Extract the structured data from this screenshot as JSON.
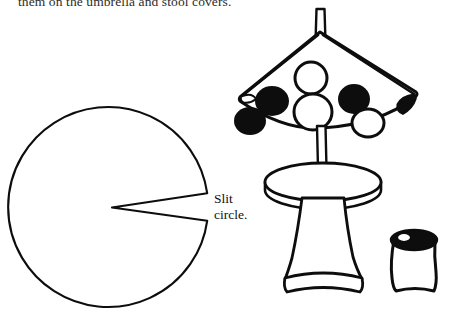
{
  "page": {
    "width": 457,
    "height": 310,
    "background_color": "#ffffff",
    "ink_color": "#0d0d0d",
    "caption_top": "them on the umbrella and stool covers.",
    "figure_description": "Line drawing craft diagram: a slit circle pattern, a polka-dot umbrella over a pedestal stool, and a small thread spool / can"
  },
  "labels": {
    "slit_circle": "Slit\ncircle.",
    "slit_circle_line1": "Slit",
    "slit_circle_line2": "circle."
  },
  "parts": {
    "slit_circle": {
      "name": "Slit circle",
      "center_x": 108,
      "center_y": 207,
      "radius": 100,
      "slit_opening_angle_deg": 8,
      "slit_side": "right",
      "fill": "#ffffff",
      "stroke": "#0d0d0d"
    },
    "umbrella": {
      "name": "Umbrella",
      "canopy_left_tip_x": 238,
      "canopy_right_tip_x": 418,
      "canopy_apex_x": 320,
      "canopy_apex_y": 36,
      "canopy_bottom_y": 124,
      "pole_top_y": 8,
      "pole_bottom_y": 190,
      "dots_filled": 5,
      "dots_outlined": 3,
      "dot_fill_color": "#0d0d0d",
      "dot_outline_color": "#0d0d0d"
    },
    "stool": {
      "name": "Stool",
      "top_center_x": 323,
      "top_center_y": 182,
      "top_radius_x": 58,
      "top_radius_y": 19,
      "top_thickness": 9,
      "base_top_y": 200,
      "base_bottom_y": 292,
      "base_narrow_width": 44,
      "base_flare_width": 78
    },
    "spool": {
      "name": "Spool",
      "left_x": 389,
      "right_x": 440,
      "top_y": 231,
      "bottom_y": 292,
      "lid_fill": "#0d0d0d",
      "body_fill": "#ffffff"
    }
  },
  "icons": {
    "slit_circle_icon": "slit-circle-icon",
    "umbrella_icon": "umbrella-icon",
    "stool_icon": "stool-icon",
    "spool_icon": "spool-icon"
  }
}
